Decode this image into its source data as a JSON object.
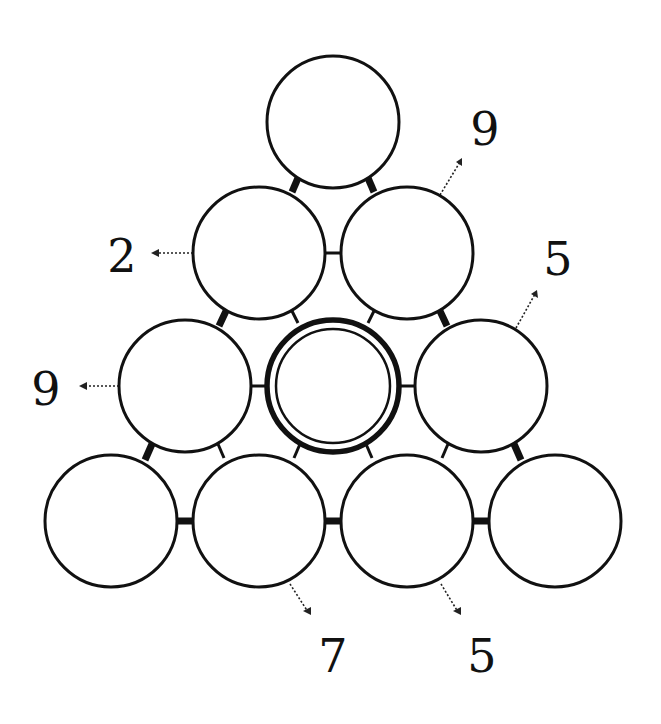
{
  "puzzle": {
    "type": "number-pyramid",
    "rows": 4,
    "circles": [
      {
        "id": "r0c0",
        "row": 0,
        "col": 0,
        "cx": 333,
        "cy": 122,
        "value": "",
        "highlighted": false
      },
      {
        "id": "r1c0",
        "row": 1,
        "col": 0,
        "cx": 259,
        "cy": 253,
        "value": "",
        "highlighted": false
      },
      {
        "id": "r1c1",
        "row": 1,
        "col": 1,
        "cx": 407,
        "cy": 253,
        "value": "",
        "highlighted": false
      },
      {
        "id": "r2c0",
        "row": 2,
        "col": 0,
        "cx": 185,
        "cy": 386,
        "value": "",
        "highlighted": false
      },
      {
        "id": "r2c1",
        "row": 2,
        "col": 1,
        "cx": 333,
        "cy": 386,
        "value": "",
        "highlighted": true
      },
      {
        "id": "r2c2",
        "row": 2,
        "col": 2,
        "cx": 481,
        "cy": 386,
        "value": "",
        "highlighted": false
      },
      {
        "id": "r3c0",
        "row": 3,
        "col": 0,
        "cx": 111,
        "cy": 521,
        "value": "",
        "highlighted": false
      },
      {
        "id": "r3c1",
        "row": 3,
        "col": 1,
        "cx": 259,
        "cy": 521,
        "value": "",
        "highlighted": false
      },
      {
        "id": "r3c2",
        "row": 3,
        "col": 2,
        "cx": 407,
        "cy": 521,
        "value": "",
        "highlighted": false
      },
      {
        "id": "r3c3",
        "row": 3,
        "col": 3,
        "cx": 555,
        "cy": 521,
        "value": "",
        "highlighted": false
      }
    ],
    "clues": [
      {
        "label": "2",
        "target": "r1c0",
        "x": 122,
        "y": 272
      },
      {
        "label": "9",
        "target": "r1c1",
        "x": 485,
        "y": 145
      },
      {
        "label": "9",
        "target": "r2c0",
        "x": 46,
        "y": 405
      },
      {
        "label": "5",
        "target": "r2c2",
        "x": 558,
        "y": 275
      },
      {
        "label": "7",
        "target": "r3c1",
        "x": 333,
        "y": 672
      },
      {
        "label": "5",
        "target": "r3c2",
        "x": 482,
        "y": 672
      }
    ],
    "colors": {
      "stroke": "#111111",
      "fill": "#ffffff",
      "background": "#ffffff"
    }
  }
}
